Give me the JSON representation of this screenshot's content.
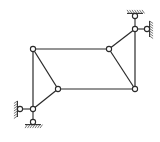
{
  "diagram": {
    "type": "truss-structure",
    "colors": {
      "line": "#2a2a2a",
      "hatch": "#555555",
      "background": "#ffffff",
      "node_fill": "#ffffff"
    },
    "nodes": [
      {
        "id": "A",
        "x": 33,
        "y": 109
      },
      {
        "id": "B",
        "x": 33,
        "y": 49
      },
      {
        "id": "C",
        "x": 58,
        "y": 89
      },
      {
        "id": "D",
        "x": 109,
        "y": 49
      },
      {
        "id": "E",
        "x": 135,
        "y": 29
      },
      {
        "id": "F",
        "x": 135,
        "y": 89
      }
    ],
    "members": [
      [
        "A",
        "B"
      ],
      [
        "B",
        "D"
      ],
      [
        "B",
        "C"
      ],
      [
        "A",
        "C"
      ],
      [
        "C",
        "F"
      ],
      [
        "D",
        "F"
      ],
      [
        "D",
        "E"
      ],
      [
        "E",
        "F"
      ]
    ],
    "supports": [
      {
        "id": "SA-left",
        "node": "A",
        "pin": {
          "x": 20,
          "y": 109
        },
        "ground": "left"
      },
      {
        "id": "SA-bottom",
        "node": "A",
        "pin": {
          "x": 33,
          "y": 122
        },
        "ground": "bottom"
      },
      {
        "id": "SE-top",
        "node": "E",
        "pin": {
          "x": 135,
          "y": 16
        },
        "ground": "top"
      },
      {
        "id": "SE-right",
        "node": "E",
        "pin": {
          "x": 147,
          "y": 29
        },
        "ground": "right"
      }
    ]
  }
}
